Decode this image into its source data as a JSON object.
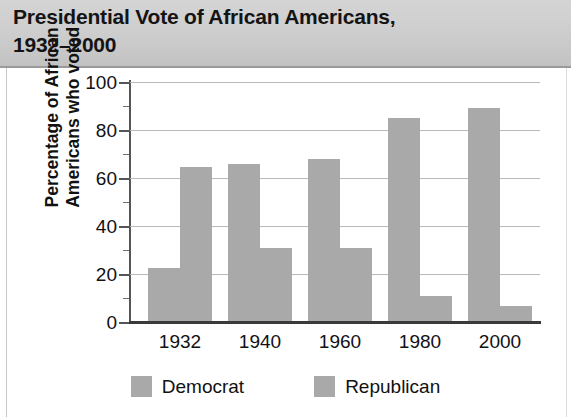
{
  "header": {
    "title": "Presidential Vote of African Americans,\n1932–2000"
  },
  "axes": {
    "y_title": "Percentage of African\nAmericans who voted",
    "y_ticks": [
      "0",
      "20",
      "40",
      "60",
      "80",
      "100"
    ],
    "x_ticks": [
      "1932",
      "1940",
      "1960",
      "1980",
      "2000"
    ]
  },
  "legend": {
    "items": [
      {
        "label": "Democrat",
        "color": "#a9a9a9"
      },
      {
        "label": "Republican",
        "color": "#a9a9a9"
      }
    ]
  },
  "colors": {
    "bar_fill": "#a9a9a9",
    "header_band": "#cccccc",
    "gridline": "#b9b9b9",
    "axis_line": "#3a3a3a",
    "text": "#111111"
  },
  "chart_data": {
    "type": "bar",
    "title": "Presidential Vote of African Americans, 1932–2000",
    "xlabel": "",
    "ylabel": "Percentage of African Americans who voted",
    "ylim": [
      0,
      100
    ],
    "ytick_interval": 20,
    "yminor_tick_interval": 10,
    "grid": true,
    "legend_position": "bottom",
    "categories": [
      "1932",
      "1940",
      "1960",
      "1980",
      "2000"
    ],
    "series": [
      {
        "name": "Democrat",
        "color": "#a9a9a9",
        "values": [
          22.5,
          66,
          68,
          85,
          89
        ]
      },
      {
        "name": "Republican",
        "color": "#a9a9a9",
        "values": [
          64.5,
          31,
          31,
          11,
          6.5
        ]
      }
    ]
  }
}
